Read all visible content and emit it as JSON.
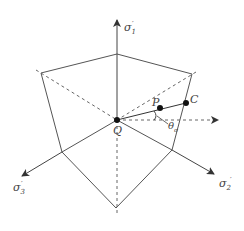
{
  "diagram": {
    "labels": {
      "sigma1": "σ",
      "sigma1_sub": "1",
      "sigma2": "σ",
      "sigma2_sub": "2",
      "sigma3": "σ",
      "sigma3_sub": "3",
      "prime": "′",
      "point_q": "Q",
      "point_p": "P",
      "point_c": "C",
      "theta": "θ",
      "theta_sub": "σ"
    },
    "colors": {
      "line": "#555555",
      "point": "#111111"
    }
  }
}
